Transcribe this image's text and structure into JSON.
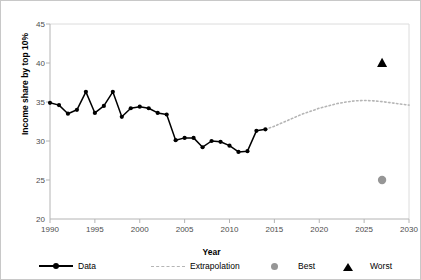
{
  "chart_data": {
    "type": "line",
    "title": "",
    "xlabel": "Year",
    "ylabel": "Income share by top 10%",
    "xlim": [
      1990,
      2030
    ],
    "ylim": [
      20,
      45
    ],
    "xticks": [
      1990,
      1995,
      2000,
      2005,
      2010,
      2015,
      2020,
      2025,
      2030
    ],
    "yticks": [
      20,
      25,
      30,
      35,
      40,
      45
    ],
    "grid": false,
    "legend_position": "bottom",
    "series": [
      {
        "name": "Data",
        "style": "solid-line-with-markers",
        "color": "#000000",
        "x": [
          1990,
          1991,
          1992,
          1993,
          1994,
          1995,
          1996,
          1997,
          1998,
          1999,
          2000,
          2001,
          2002,
          2003,
          2004,
          2005,
          2006,
          2007,
          2008,
          2009,
          2010,
          2011,
          2012,
          2013,
          2014
        ],
        "values": [
          34.9,
          34.6,
          33.5,
          34.0,
          36.3,
          33.6,
          34.5,
          36.3,
          33.1,
          34.2,
          34.4,
          34.2,
          33.6,
          33.4,
          30.1,
          30.4,
          30.4,
          29.2,
          30.0,
          29.9,
          29.4,
          28.6,
          28.7,
          31.3,
          31.5
        ]
      },
      {
        "name": "Extrapolation",
        "style": "dotted-line",
        "color": "#b5b5b5",
        "x": [
          2014,
          2015,
          2016,
          2017,
          2018,
          2019,
          2020,
          2021,
          2022,
          2023,
          2024,
          2025,
          2026,
          2027,
          2028,
          2029,
          2030
        ],
        "values": [
          31.5,
          31.9,
          32.4,
          32.9,
          33.4,
          33.8,
          34.2,
          34.5,
          34.8,
          35.0,
          35.15,
          35.2,
          35.15,
          35.05,
          34.9,
          34.75,
          34.6
        ]
      }
    ],
    "points": [
      {
        "name": "Best",
        "marker": "circle",
        "color": "#969696",
        "x": 2027,
        "y": 25.0
      },
      {
        "name": "Worst",
        "marker": "triangle",
        "color": "#000000",
        "x": 2027,
        "y": 40.0
      }
    ]
  },
  "legend": {
    "items": [
      {
        "label": "Data",
        "marker": "line-dot"
      },
      {
        "label": "Extrapolation",
        "marker": "dashed-line"
      },
      {
        "label": "Best",
        "marker": "gray-circle"
      },
      {
        "label": "Worst",
        "marker": "black-triangle"
      }
    ]
  },
  "axis": {
    "y_title": "Income share by top 10%",
    "x_title": "Year"
  },
  "colors": {
    "data_line": "#000000",
    "extrapolation": "#b5b5b5",
    "best": "#969696",
    "worst": "#000000",
    "axis": "#bfbfbf",
    "tick_text": "#4d4d4d"
  }
}
